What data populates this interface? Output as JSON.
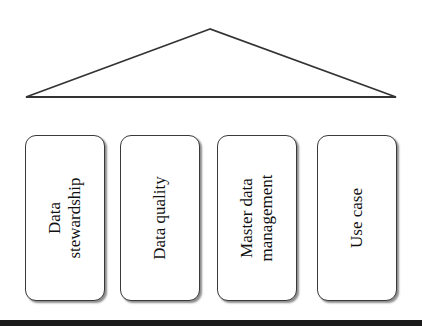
{
  "diagram": {
    "type": "pillar-house",
    "roof": {
      "shape": "triangle",
      "apex": [
        210,
        29
      ],
      "base_left": [
        26,
        97
      ],
      "base_right": [
        396,
        97
      ]
    },
    "pillars": [
      {
        "label": "Data\nstewardship"
      },
      {
        "label": "Data quality"
      },
      {
        "label": "Master data\nmanagement"
      },
      {
        "label": "Use case"
      }
    ],
    "foundation": "black-bar"
  },
  "colors": {
    "stroke": "#333333",
    "background": "#ffffff",
    "foundation": "#1a1a1a"
  }
}
